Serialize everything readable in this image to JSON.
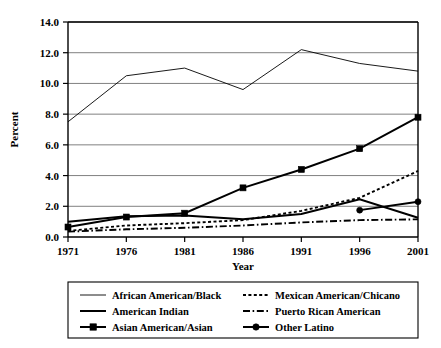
{
  "chart_data": {
    "type": "line",
    "title": "",
    "xlabel": "Year",
    "ylabel": "Percent",
    "categories": [
      "1971",
      "1976",
      "1981",
      "1986",
      "1991",
      "1996",
      "2001"
    ],
    "x": [
      1971,
      1976,
      1981,
      1986,
      1991,
      1996,
      2001
    ],
    "xlim": [
      1971,
      2001
    ],
    "ylim": [
      0.0,
      14.0
    ],
    "ytick_labels": [
      "0.0",
      "2.0",
      "4.0",
      "6.0",
      "8.0",
      "10.0",
      "12.0",
      "14.0"
    ],
    "ytick_values": [
      0.0,
      2.0,
      4.0,
      6.0,
      8.0,
      10.0,
      12.0,
      14.0
    ],
    "grid": "horizontal",
    "legend_position": "bottom",
    "series": [
      {
        "name": "African American/Black",
        "style": "thin-solid",
        "marker": "none",
        "values": [
          7.5,
          10.5,
          11.0,
          9.6,
          12.2,
          11.3,
          10.8
        ]
      },
      {
        "name": "American Indian",
        "style": "thick-solid",
        "marker": "none",
        "values": [
          1.0,
          1.35,
          1.4,
          1.15,
          1.5,
          2.45,
          1.25
        ]
      },
      {
        "name": "Asian American/Asian",
        "style": "thick-solid",
        "marker": "square",
        "values": [
          0.65,
          1.3,
          1.55,
          3.2,
          4.4,
          5.75,
          7.8
        ]
      },
      {
        "name": "Mexican American/Chicano",
        "style": "dotted",
        "marker": "none",
        "values": [
          0.4,
          0.75,
          0.9,
          1.1,
          1.7,
          2.55,
          4.3
        ]
      },
      {
        "name": "Puerto Rican American",
        "style": "dash-dot",
        "marker": "none",
        "values": [
          0.35,
          0.5,
          0.6,
          0.75,
          0.95,
          1.1,
          1.15
        ]
      },
      {
        "name": "Other Latino",
        "style": "thick-solid",
        "marker": "circle",
        "values": [
          null,
          null,
          null,
          null,
          null,
          1.75,
          2.3
        ]
      }
    ]
  },
  "legend": {
    "entries": [
      {
        "label": "African American/Black",
        "style": "thin-solid",
        "marker": "none"
      },
      {
        "label": "Mexican American/Chicano",
        "style": "dotted",
        "marker": "none"
      },
      {
        "label": "American Indian",
        "style": "thick-solid",
        "marker": "none"
      },
      {
        "label": "Puerto Rican American",
        "style": "dash-dot",
        "marker": "none"
      },
      {
        "label": "Asian American/Asian",
        "style": "thick-solid",
        "marker": "square"
      },
      {
        "label": "Other Latino",
        "style": "thick-solid",
        "marker": "circle"
      }
    ]
  },
  "colors": {
    "line": "#000000",
    "grid": "#808080",
    "frame": "#000000",
    "background": "#ffffff"
  }
}
